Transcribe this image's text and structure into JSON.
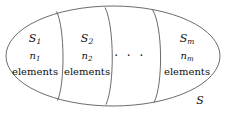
{
  "diagram": {
    "kind": "set-partition-venn",
    "outer_set_label": "S",
    "ellipsis": "· · ·",
    "stroke_color": "#5a5a5a",
    "text_color": "#111111",
    "background_color": "#ffffff",
    "regions": [
      {
        "id": "region-1",
        "set_symbol": "S",
        "set_subscript": "1",
        "count_symbol": "n",
        "count_subscript": "1",
        "unit_word": "elements"
      },
      {
        "id": "region-2",
        "set_symbol": "S",
        "set_subscript": "2",
        "count_symbol": "n",
        "count_subscript": "2",
        "unit_word": "elements"
      },
      {
        "id": "region-m",
        "set_symbol": "S",
        "set_subscript": "m",
        "count_symbol": "n",
        "count_subscript": "m",
        "unit_word": "elements"
      }
    ]
  }
}
